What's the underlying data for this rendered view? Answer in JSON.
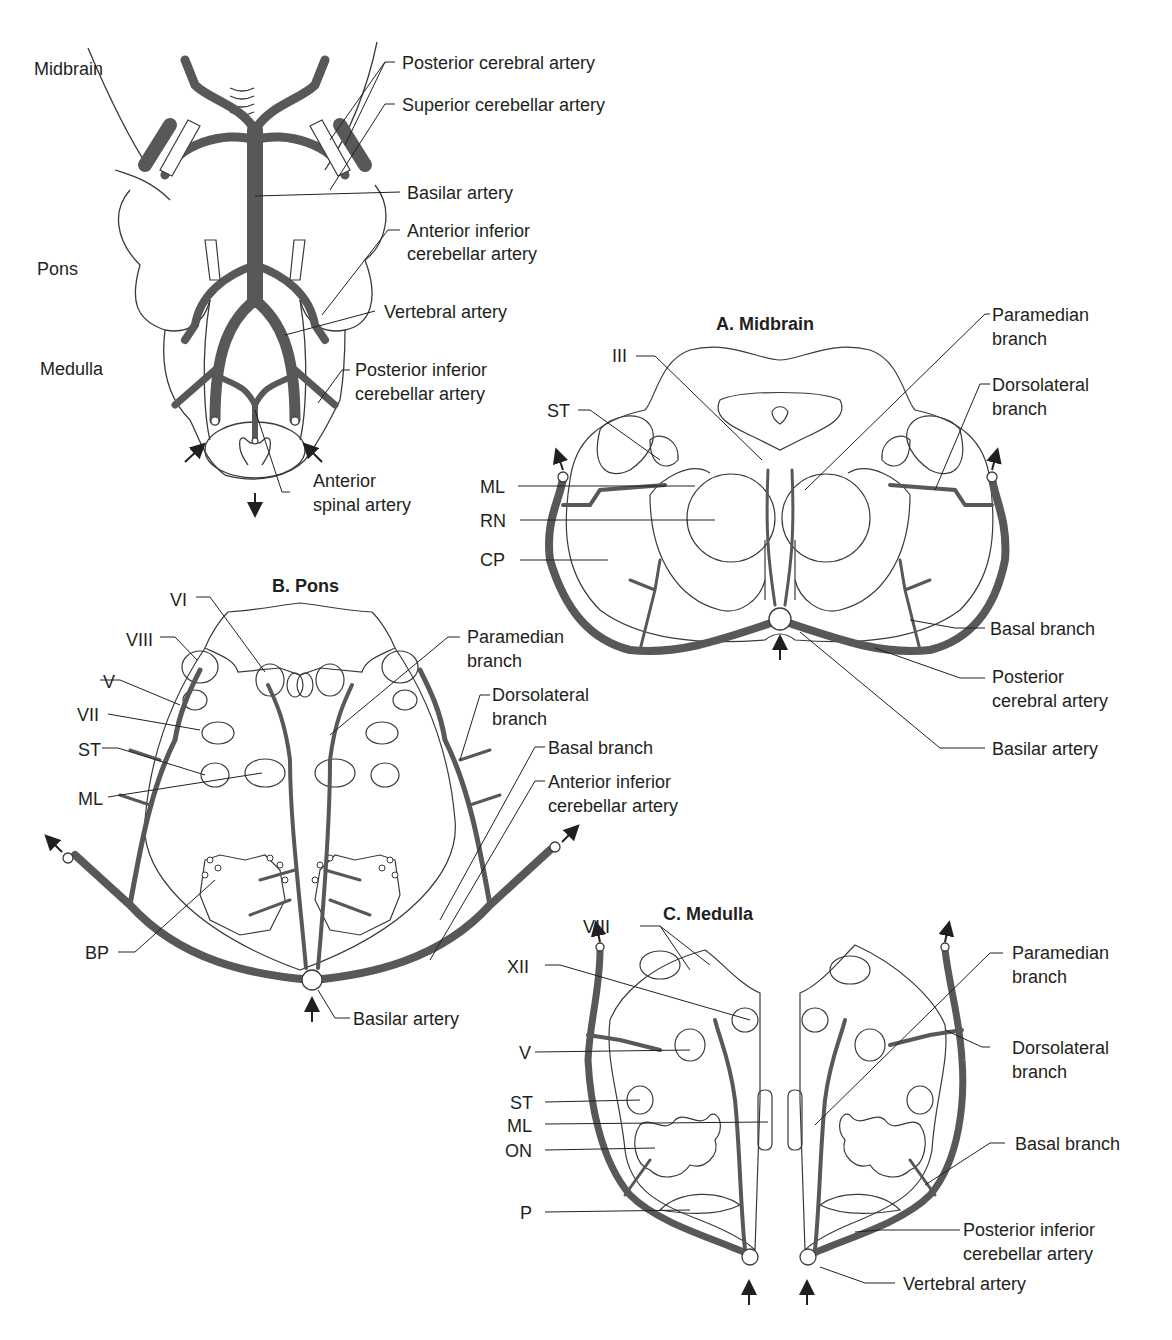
{
  "colors": {
    "artery": "#58585a",
    "outline": "#3a3a3a",
    "text": "#231f20",
    "background": "#ffffff"
  },
  "overview": {
    "regions": [
      "Midbrain",
      "Pons",
      "Medulla"
    ],
    "labels": {
      "posterior_cerebral": "Posterior cerebral artery",
      "superior_cerebellar": "Superior cerebellar artery",
      "basilar": "Basilar artery",
      "aica_1": "Anterior inferior",
      "aica_2": "cerebellar artery",
      "vertebral": "Vertebral artery",
      "pica_1": "Posterior inferior",
      "pica_2": "cerebellar artery",
      "anterior_spinal_1": "Anterior",
      "anterior_spinal_2": "spinal artery"
    }
  },
  "midbrain": {
    "title": "A. Midbrain",
    "left_labels": [
      "III",
      "ST",
      "ML",
      "RN",
      "CP"
    ],
    "right_labels": {
      "paramedian_1": "Paramedian",
      "paramedian_2": "branch",
      "dorsolateral_1": "Dorsolateral",
      "dorsolateral_2": "branch",
      "basal": "Basal branch",
      "pca_1": "Posterior",
      "pca_2": "cerebral artery",
      "basilar": "Basilar artery"
    }
  },
  "pons": {
    "title": "B. Pons",
    "left_labels": [
      "VI",
      "VIII",
      "V",
      "VII",
      "ST",
      "ML",
      "BP"
    ],
    "right_labels": {
      "paramedian_1": "Paramedian",
      "paramedian_2": "branch",
      "dorsolateral_1": "Dorsolateral",
      "dorsolateral_2": "branch",
      "basal": "Basal branch",
      "aica_1": "Anterior inferior",
      "aica_2": "cerebellar artery",
      "basilar": "Basilar artery"
    }
  },
  "medulla": {
    "title": "C. Medulla",
    "left_labels": [
      "VIII",
      "XII",
      "V",
      "ST",
      "ML",
      "ON",
      "P"
    ],
    "right_labels": {
      "paramedian_1": "Paramedian",
      "paramedian_2": "branch",
      "dorsolateral_1": "Dorsolateral",
      "dorsolateral_2": "branch",
      "basal": "Basal branch",
      "pica_1": "Posterior inferior",
      "pica_2": "cerebellar artery",
      "vertebral": "Vertebral artery"
    }
  }
}
